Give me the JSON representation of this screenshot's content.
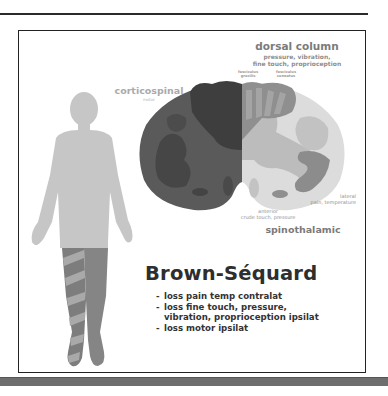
{
  "figure": {
    "title": "Brown-Séquard",
    "findings": [
      {
        "line1": "loss pain temp contralat",
        "line2": ""
      },
      {
        "line1": "loss fine touch, pressure,",
        "line2": "vibration, proprioception ipsilat"
      },
      {
        "line1": "loss motor ipsilat",
        "line2": ""
      }
    ],
    "bullet": "-"
  },
  "spinal_cord": {
    "dorsal_column": {
      "title": "dorsal column",
      "modalities_line1": "pressure, vibration,",
      "modalities_line2": "fine touch, proprioception",
      "fasciculus_gracilis_line1": "fasciculus",
      "fasciculus_gracilis_line2": "gracilis",
      "fasciculus_cuneatus_line1": "fasciculus",
      "fasciculus_cuneatus_line2": "cuneatus"
    },
    "corticospinal": {
      "title": "corticospinal",
      "modality": "motor"
    },
    "spinothalamic": {
      "title": "spinothalamic",
      "lateral_label": "lateral",
      "lateral_modality": "pain, temperature",
      "anterior_label": "anterior",
      "anterior_modality": "crude touch, pressure"
    }
  },
  "colors": {
    "lesioned_half_dark": "#4a4a4a",
    "lesioned_half_mid": "#5e5e5e",
    "intact_half_light": "#d8d8d8",
    "intact_half_mid": "#b5b5b5",
    "body_silhouette": "#c6c6c6",
    "affected_leg": "#7d7d7d",
    "stripe": "#a9a9a9",
    "frame_border": "#222222"
  }
}
